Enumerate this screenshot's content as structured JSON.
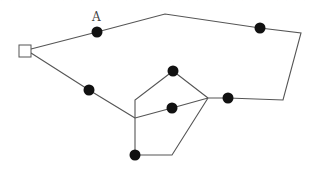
{
  "header": {
    "clipped_text": "ー ー ー ー ー ー ー ー ー ー ー ー ー ー ー ー ー ー ー ー ー ー"
  },
  "diagram": {
    "type": "graph",
    "colors": {
      "edge": "#555555",
      "node": "#111111",
      "start_node_fill": "#ffffff"
    },
    "start": {
      "id": "S",
      "shape": "square",
      "x": 25,
      "y": 51,
      "size": 12
    },
    "labels": [
      {
        "text": "A",
        "x": 92,
        "y": 21
      }
    ],
    "nodes": [
      {
        "id": "A",
        "x": 97,
        "y": 32
      },
      {
        "id": "N1",
        "x": 260,
        "y": 28
      },
      {
        "id": "N2",
        "x": 228,
        "y": 98
      },
      {
        "id": "N3",
        "x": 89,
        "y": 90
      },
      {
        "id": "N4",
        "x": 173,
        "y": 71
      },
      {
        "id": "N5",
        "x": 172,
        "y": 108
      },
      {
        "id": "N6",
        "x": 135,
        "y": 155
      }
    ],
    "waypoints": [
      {
        "id": "P",
        "x": 165,
        "y": 14
      },
      {
        "id": "C1",
        "x": 301,
        "y": 33
      },
      {
        "id": "C2",
        "x": 283,
        "y": 100
      },
      {
        "id": "J",
        "x": 208,
        "y": 98
      },
      {
        "id": "K",
        "x": 135,
        "y": 118
      },
      {
        "id": "V",
        "x": 135,
        "y": 100
      },
      {
        "id": "B",
        "x": 172,
        "y": 155
      }
    ],
    "paths": [
      "M31 49 L97 32 L165 14 L260 28 L301 33 L283 100 L228 98 L208 98",
      "M31 53 L89 90 L135 118",
      "M135 118 L172 108 L208 98",
      "M135 118 L135 100 L173 71 L208 98",
      "M135 118 L135 155 L172 155 L208 98"
    ]
  }
}
